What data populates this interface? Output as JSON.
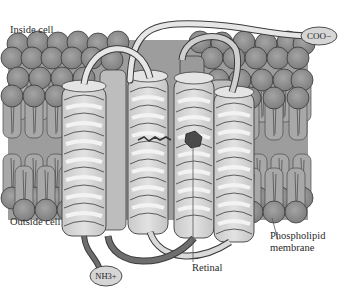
{
  "diagram": {
    "labels": {
      "inside": "Inside cell",
      "outside": "Outside cell",
      "c_terminus": "COO−",
      "n_terminus": "NH3+",
      "retinal": "Retinal",
      "membrane_line1": "Phospholipid",
      "membrane_line2": "membrane"
    },
    "helix_count": 7,
    "colors": {
      "lipid_head": "#8e8e8e",
      "lipid_head_edge": "#3a3a3a",
      "lipid_tail": "#a9a9a9",
      "helix_fill": "#d8d8d8",
      "helix_ribbon": "#eeeeee",
      "outline": "#3c3c3c",
      "retinal": "#4a4a4a",
      "terminus_fill": "#d2d2d2",
      "n_loop_dark": "#6e6e6e"
    }
  }
}
